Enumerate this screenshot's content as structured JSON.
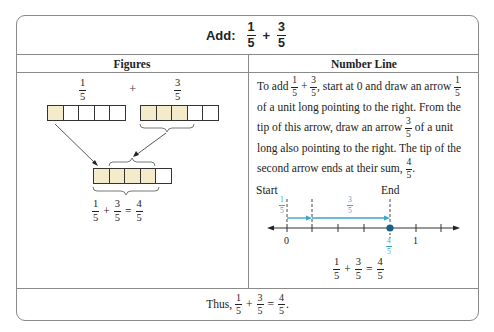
{
  "title": {
    "label": "Add:",
    "fraction_a": {
      "num": "1",
      "den": "5"
    },
    "operator": "+",
    "fraction_b": {
      "num": "3",
      "den": "5"
    }
  },
  "columns": {
    "figures_header": "Figures",
    "numberline_header": "Number Line"
  },
  "figures": {
    "top_left_fraction": {
      "num": "1",
      "den": "5"
    },
    "plus": "+",
    "top_right_fraction": {
      "num": "3",
      "den": "5"
    },
    "bar_left": {
      "cells": 5,
      "filled": 1
    },
    "bar_right": {
      "cells": 5,
      "filled": 3
    },
    "bar_result": {
      "cells": 5,
      "filled": 4
    },
    "equation": {
      "a": {
        "num": "1",
        "den": "5"
      },
      "plus": "+",
      "b": {
        "num": "3",
        "den": "5"
      },
      "equals": "=",
      "c": {
        "num": "4",
        "den": "5"
      }
    },
    "fill_color": "#f3ebc9"
  },
  "number_line": {
    "text_parts": {
      "p1": "To add",
      "plus": "+",
      "p2": ", start at 0 and draw an arrow",
      "p3": "of a unit long pointing to the right. From the tip of this arrow, draw an arrow",
      "p4": "of a unit long also pointing to the right. The tip of the second arrow ends at their sum,",
      "p5": "."
    },
    "f_1_5": {
      "num": "1",
      "den": "5"
    },
    "f_3_5": {
      "num": "3",
      "den": "5"
    },
    "f_4_5": {
      "num": "4",
      "den": "5"
    },
    "start_label": "Start",
    "end_label": "End",
    "tick_0": "0",
    "tick_1": "1",
    "arrow1_label": {
      "num": "1",
      "den": "5"
    },
    "arrow2_label": {
      "num": "3",
      "den": "5"
    },
    "point_label": {
      "num": "4",
      "den": "5"
    },
    "accent_color": "#3aa6cf",
    "point_color": "#1e5f8a",
    "equation": {
      "a": {
        "num": "1",
        "den": "5"
      },
      "plus": "+",
      "b": {
        "num": "3",
        "den": "5"
      },
      "equals": "=",
      "c": {
        "num": "4",
        "den": "5"
      }
    }
  },
  "conclusion": {
    "prefix": "Thus,",
    "a": {
      "num": "1",
      "den": "5"
    },
    "plus": "+",
    "b": {
      "num": "3",
      "den": "5"
    },
    "equals": "=",
    "c": {
      "num": "4",
      "den": "5"
    },
    "suffix": "."
  }
}
